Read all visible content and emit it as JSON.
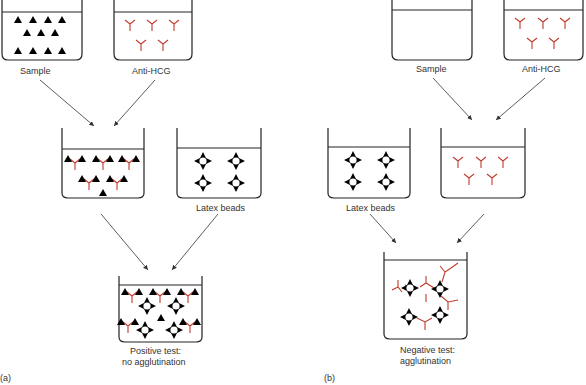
{
  "panel_a": {
    "label": "(a)",
    "sample_label": "Sample",
    "anti_hcg_label": "Anti-HCG",
    "latex_label": "Latex beads",
    "result_line1": "Positive test:",
    "result_line2": "no agglutination"
  },
  "panel_b": {
    "label": "(b)",
    "sample_label": "Sample",
    "anti_hcg_label": "Anti-HCG",
    "latex_label": "Latex beads",
    "result_line1": "Negative test:",
    "result_line2": "agglutination"
  },
  "colors": {
    "antibody": "#c0392b",
    "outline": "#222222",
    "arrow": "#333333",
    "hcg": "#000000"
  }
}
